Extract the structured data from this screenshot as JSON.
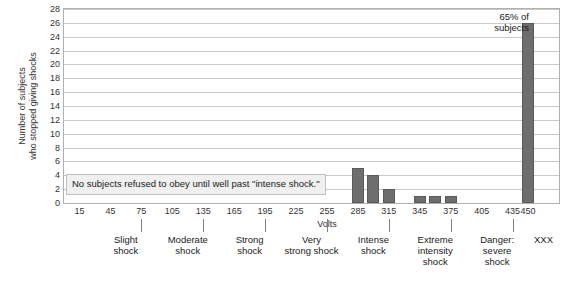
{
  "chart_data": {
    "type": "bar",
    "title": "",
    "xlabel": "Volts",
    "ylabel": "Number of subjects who stopped giving shocks",
    "ylabel_lines": [
      "Number of subjects",
      "who stopped giving shocks"
    ],
    "ylim": [
      0,
      28
    ],
    "ytick_step": 2,
    "grid": true,
    "legend": "none",
    "categories": [
      15,
      30,
      45,
      60,
      75,
      90,
      105,
      120,
      135,
      150,
      165,
      180,
      195,
      210,
      225,
      240,
      255,
      270,
      285,
      300,
      315,
      330,
      345,
      360,
      375,
      390,
      405,
      420,
      435,
      450
    ],
    "values": [
      0,
      0,
      0,
      0,
      0,
      0,
      0,
      0,
      0,
      0,
      0,
      0,
      0,
      0,
      0,
      0,
      0,
      0,
      5,
      4,
      2,
      0,
      1,
      1,
      1,
      0,
      0,
      0,
      0,
      26
    ],
    "x_tick_labels": [
      "15",
      "45",
      "75",
      "105",
      "135",
      "165",
      "195",
      "225",
      "255",
      "285",
      "315",
      "345",
      "375",
      "405",
      "435",
      "450"
    ],
    "x_tick_values": [
      15,
      45,
      75,
      105,
      135,
      165,
      195,
      225,
      255,
      285,
      315,
      345,
      375,
      405,
      435,
      450
    ],
    "y_tick_labels": [
      "0",
      "2",
      "4",
      "6",
      "8",
      "10",
      "12",
      "14",
      "16",
      "18",
      "20",
      "22",
      "24",
      "26",
      "28"
    ],
    "y_tick_values": [
      0,
      2,
      4,
      6,
      8,
      10,
      12,
      14,
      16,
      18,
      20,
      22,
      24,
      26,
      28
    ],
    "category_bands": [
      {
        "label_lines": [
          "Slight",
          "shock"
        ],
        "tick_value": 75,
        "center_value": 60
      },
      {
        "label_lines": [
          "Moderate",
          "shock"
        ],
        "tick_value": 135,
        "center_value": 120
      },
      {
        "label_lines": [
          "Strong",
          "shock"
        ],
        "tick_value": 195,
        "center_value": 180
      },
      {
        "label_lines": [
          "Very",
          "strong shock"
        ],
        "tick_value": 255,
        "center_value": 240
      },
      {
        "label_lines": [
          "Intense",
          "shock"
        ],
        "tick_value": 315,
        "center_value": 300
      },
      {
        "label_lines": [
          "Extreme",
          "intensity",
          "shock"
        ],
        "tick_value": 375,
        "center_value": 360
      },
      {
        "label_lines": [
          "Danger:",
          "severe",
          "shock"
        ],
        "tick_value": 435,
        "center_value": 420
      },
      {
        "label_lines": [
          "XXX"
        ],
        "tick_value": null,
        "center_value": 465
      }
    ],
    "annotations": [
      {
        "name": "no-refusal-note",
        "text": "No subjects refused to obey until well past \"intense shock.\"",
        "anchor_value": 3,
        "box": true
      },
      {
        "name": "sixty-five-percent-note",
        "lines": [
          "65% of",
          "subjects"
        ],
        "anchor_value": 450
      }
    ],
    "colors": {
      "bar_fill": "#6e6e6e",
      "bar_stroke": "#5a5a5a",
      "gridline": "#c9c9c9",
      "axis_frame": "#b0b0b0",
      "text": "#333333",
      "annotation_bg": "#f0f0f0",
      "annotation_border": "#c0c0c0",
      "background": "#ffffff"
    }
  }
}
